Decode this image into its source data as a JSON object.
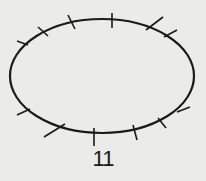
{
  "figure": {
    "label": "11",
    "shape": "ellipse",
    "tick_count": 12,
    "stroke_color": "#1a1a1a",
    "background_color": "#ebebea"
  }
}
